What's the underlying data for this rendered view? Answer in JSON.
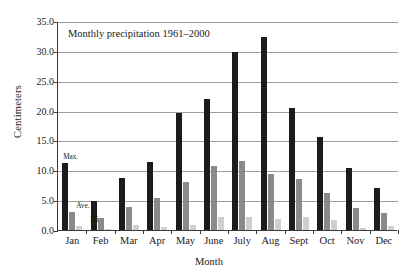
{
  "chart_data": {
    "type": "bar",
    "title": "Monthly precipitation 1961–2000",
    "xlabel": "Month",
    "ylabel": "Centimeters",
    "ylim": [
      0.0,
      35.0
    ],
    "ytick_step": 5.0,
    "ytick_labels": [
      "0.0",
      "5.0",
      "10.0",
      "15.0",
      "20.0",
      "25.0",
      "30.0",
      "35.0"
    ],
    "ytick_values": [
      0.0,
      5.0,
      10.0,
      15.0,
      20.0,
      25.0,
      30.0,
      35.0
    ],
    "grid": true,
    "legend_position": "inline-callouts",
    "categories": [
      "Jan",
      "Feb",
      "Mar",
      "Apr",
      "May",
      "June",
      "July",
      "Aug",
      "Sept",
      "Oct",
      "Nov",
      "Dec"
    ],
    "series": [
      {
        "name": "Max.",
        "color": "#1c1c1c",
        "values": [
          11.3,
          4.8,
          8.7,
          11.4,
          19.6,
          21.9,
          29.8,
          32.3,
          20.4,
          15.5,
          10.4,
          7.0
        ]
      },
      {
        "name": "Ave.",
        "color": "#8a8a8a",
        "values": [
          3.0,
          2.0,
          3.8,
          5.3,
          8.0,
          10.8,
          11.5,
          9.3,
          8.5,
          6.2,
          3.7,
          2.8
        ]
      },
      {
        "name": "Min.",
        "color": "#cfcfcf",
        "values": [
          0.7,
          0.1,
          0.8,
          0.5,
          0.8,
          2.1,
          2.1,
          1.9,
          2.2,
          1.6,
          0.3,
          0.7
        ]
      }
    ],
    "annotations": [
      {
        "text": "Max.",
        "series": "Max.",
        "category": "Jan"
      },
      {
        "text": "Ave.",
        "series": "Ave.",
        "category": "Jan"
      },
      {
        "text": "Min.",
        "series": "Min.",
        "category": "Jan"
      }
    ]
  }
}
